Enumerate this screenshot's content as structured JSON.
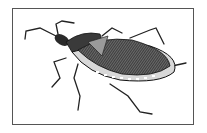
{
  "figure": {
    "colors": {
      "ink": "#1a1a1a",
      "mid": "#6a6a6a",
      "light": "#bdbdbd",
      "border": "#555555",
      "background": "#ffffff"
    }
  }
}
